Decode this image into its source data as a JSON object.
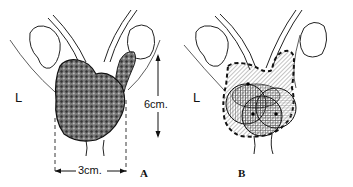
{
  "figure": {
    "panel_a": {
      "panel_label": "A",
      "side_label": "L",
      "height_label": "6cm.",
      "width_label": "3cm."
    },
    "panel_b": {
      "panel_label": "B",
      "side_label": "L"
    }
  }
}
